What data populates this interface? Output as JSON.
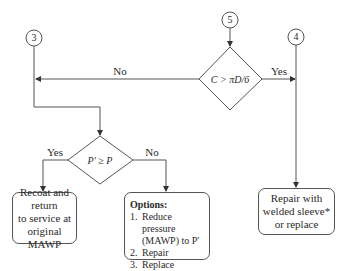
{
  "connectors": [
    {
      "id": "3",
      "label": "3"
    },
    {
      "id": "5",
      "label": "5"
    },
    {
      "id": "4",
      "label": "4"
    }
  ],
  "decisions": {
    "circumference": {
      "label": "C > πD/6",
      "yes_label": "Yes",
      "no_label": "No"
    },
    "pressure": {
      "label": "P′ ≥ P",
      "yes_label": "Yes",
      "no_label": "No"
    }
  },
  "outcomes": {
    "recoat": {
      "lines": [
        "Recoat and return",
        "to service at",
        "original MAWP"
      ]
    },
    "options": {
      "title": "Options:",
      "items": [
        {
          "num": "1.",
          "text": "Reduce pressure",
          "text2": "(MAWP) to P′"
        },
        {
          "num": "2.",
          "text": "Repair"
        },
        {
          "num": "3.",
          "text": "Replace"
        }
      ]
    },
    "sleeve": {
      "lines": [
        "Repair with",
        "welded sleeve*",
        "or replace"
      ]
    }
  },
  "colors": {
    "line": "#444444",
    "text": "#2a2a2a",
    "background": "#ffffff"
  }
}
